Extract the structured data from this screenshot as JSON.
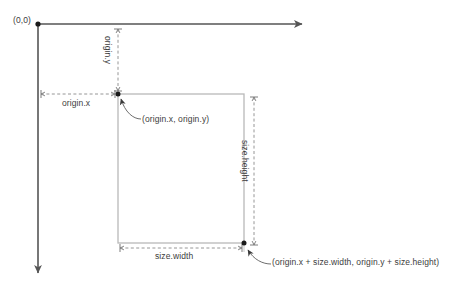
{
  "diagram": {
    "colors": {
      "axis": "#555555",
      "rect_stroke": "#b5b5b5",
      "dimension_line": "#8a8a8a",
      "point_dot": "#1a1a1a",
      "leader_line": "#6e6e6e",
      "text": "#3d3d3d",
      "background": "#ffffff"
    },
    "labels": {
      "coordinate_origin": "(0,0)",
      "origin_x": "origin.x",
      "origin_y": "origin.y",
      "size_width": "size.width",
      "size_height": "size.height",
      "origin_point": "(origin.x, origin.y)",
      "far_corner_point": "(origin.x + size.width, origin.y + size.height)"
    },
    "icons": {
      "axis_arrow_x": "arrow-right-icon",
      "axis_arrow_y": "arrow-down-icon",
      "leader_arrow": "arrowhead-icon",
      "point_marker": "dot-marker-icon"
    },
    "geometry": {
      "coordinate_origin": [
        38,
        24
      ],
      "x_axis_end": [
        309,
        24
      ],
      "y_axis_end": [
        38,
        280
      ],
      "rect_top_left": [
        118,
        94
      ],
      "rect_bottom_right": [
        244,
        243
      ],
      "origin_x_measure": {
        "from": [
          40,
          94
        ],
        "to": [
          118,
          94
        ]
      },
      "origin_y_measure": {
        "from": [
          118,
          26
        ],
        "to": [
          118,
          94
        ]
      },
      "size_width_measure": {
        "from": [
          118,
          248
        ],
        "to": [
          244,
          248
        ]
      },
      "size_height_measure": {
        "from": [
          254,
          94
        ],
        "to": [
          254,
          248
        ]
      }
    }
  }
}
